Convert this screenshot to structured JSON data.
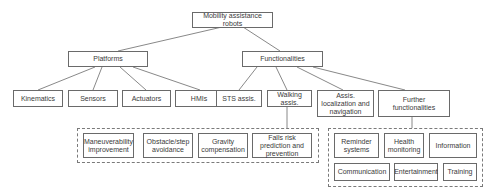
{
  "diagram": {
    "type": "hierarchy-tree",
    "root": {
      "id": "root",
      "label": "Mobility assistance robots"
    },
    "level1": [
      {
        "id": "platforms",
        "label": "Platforms"
      },
      {
        "id": "functionalities",
        "label": "Functionalities"
      }
    ],
    "platforms_children": [
      {
        "id": "kinematics",
        "label": "Kinematics"
      },
      {
        "id": "sensors",
        "label": "Sensors"
      },
      {
        "id": "actuators",
        "label": "Actuators"
      },
      {
        "id": "hmis",
        "label": "HMIs"
      }
    ],
    "functionalities_children": [
      {
        "id": "sts",
        "label": "STS assis."
      },
      {
        "id": "walking",
        "label": "Walking assis."
      },
      {
        "id": "localization",
        "label": "Assis. localization and navigation"
      },
      {
        "id": "further",
        "label": "Further functionalities"
      }
    ],
    "walking_group": [
      {
        "id": "maneuverability",
        "label": "Maneuverability improvement"
      },
      {
        "id": "obstacle",
        "label": "Obstacle/step avoidance"
      },
      {
        "id": "gravity",
        "label": "Gravity compensation"
      },
      {
        "id": "falls",
        "label": "Falls risk prediction and prevention"
      }
    ],
    "further_group": [
      {
        "id": "reminder",
        "label": "Reminder systems"
      },
      {
        "id": "health",
        "label": "Health monitoring"
      },
      {
        "id": "information",
        "label": "Information"
      },
      {
        "id": "communication",
        "label": "Communication"
      },
      {
        "id": "entertainment",
        "label": "Entertainment"
      },
      {
        "id": "training",
        "label": "Training"
      }
    ],
    "edges": [
      [
        "root",
        "platforms"
      ],
      [
        "root",
        "functionalities"
      ],
      [
        "platforms",
        "kinematics"
      ],
      [
        "platforms",
        "sensors"
      ],
      [
        "platforms",
        "actuators"
      ],
      [
        "platforms",
        "hmis"
      ],
      [
        "functionalities",
        "sts"
      ],
      [
        "functionalities",
        "walking"
      ],
      [
        "functionalities",
        "localization"
      ],
      [
        "functionalities",
        "further"
      ],
      [
        "walking",
        "walking_group"
      ],
      [
        "further",
        "further_group"
      ]
    ],
    "colors": {
      "border": "#6a6a6a",
      "line": "#6a6a6a",
      "text": "#3a3a3a",
      "background": "#ffffff"
    }
  }
}
